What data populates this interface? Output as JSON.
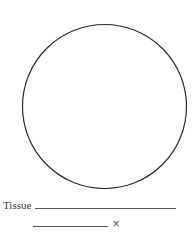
{
  "worksheet": {
    "field_of_view": "microscope-field-circle",
    "tissue_label": "Tissue",
    "tissue_value": "",
    "magnification_value": "",
    "magnification_symbol": "×"
  }
}
